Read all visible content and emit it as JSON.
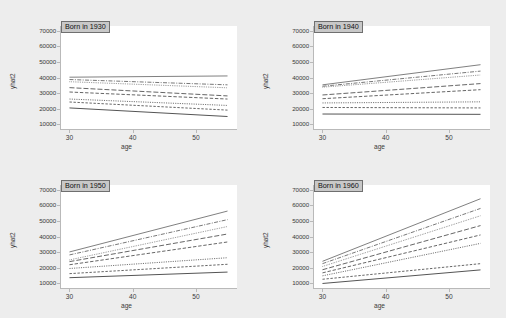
{
  "figure": {
    "panel_count": 4,
    "background_color": "#ededed",
    "plot_background_color": "#ffffff",
    "axis_color": "#b9b9b9",
    "line_color": "#555555",
    "title_box_fill": "#c8c8c8",
    "title_box_border": "#6f6f6f"
  },
  "chart_data": {
    "type": "line",
    "title": "",
    "xlabel": "age",
    "ylabel": "yhat2",
    "xlim": [
      28.5,
      56.5
    ],
    "ylim": [
      7000,
      73000
    ],
    "xticks": [
      30,
      40,
      50
    ],
    "xtick_labels": [
      "30",
      "40",
      "50"
    ],
    "yticks": [
      10000,
      20000,
      30000,
      40000,
      50000,
      60000,
      70000
    ],
    "ytick_labels": [
      "10000",
      "20000",
      "30000",
      "40000",
      "50000",
      "60000",
      "70000"
    ],
    "grid": false,
    "legend": "none",
    "x_start": 30,
    "x_end": 55,
    "line_styles": [
      "solid",
      "dash-dot",
      "dotted-fine",
      "long-dash",
      "dash",
      "dotted",
      "dash-short",
      "solid-thick"
    ],
    "panels": [
      {
        "title": "Born in 1930",
        "series": [
          {
            "name": "group-1",
            "style": "solid",
            "y_start": 40200,
            "y_end": 41000
          },
          {
            "name": "group-2",
            "style": "dash-dot",
            "y_start": 38700,
            "y_end": 35300
          },
          {
            "name": "group-3",
            "style": "dotted-fine",
            "y_start": 37300,
            "y_end": 33400
          },
          {
            "name": "group-4",
            "style": "long-dash",
            "y_start": 33500,
            "y_end": 28200
          },
          {
            "name": "group-5",
            "style": "dash",
            "y_start": 30700,
            "y_end": 26200
          },
          {
            "name": "group-6",
            "style": "dotted",
            "y_start": 26200,
            "y_end": 22100
          },
          {
            "name": "group-7",
            "style": "dash-short",
            "y_start": 24300,
            "y_end": 19100
          },
          {
            "name": "group-8",
            "style": "solid-thick",
            "y_start": 20500,
            "y_end": 15000
          }
        ]
      },
      {
        "title": "Born in 1940",
        "series": [
          {
            "name": "group-1",
            "style": "solid",
            "y_start": 35300,
            "y_end": 48200
          },
          {
            "name": "group-2",
            "style": "dash-dot",
            "y_start": 34400,
            "y_end": 44100
          },
          {
            "name": "group-3",
            "style": "dotted-fine",
            "y_start": 33800,
            "y_end": 41600
          },
          {
            "name": "group-4",
            "style": "long-dash",
            "y_start": 28800,
            "y_end": 36100
          },
          {
            "name": "group-5",
            "style": "dash",
            "y_start": 26400,
            "y_end": 32200
          },
          {
            "name": "group-6",
            "style": "dotted",
            "y_start": 23700,
            "y_end": 24400
          },
          {
            "name": "group-7",
            "style": "dash-short",
            "y_start": 20800,
            "y_end": 20500
          },
          {
            "name": "group-8",
            "style": "solid-thick",
            "y_start": 16600,
            "y_end": 16400
          }
        ]
      },
      {
        "title": "Born in 1950",
        "series": [
          {
            "name": "group-1",
            "style": "solid",
            "y_start": 30100,
            "y_end": 56300
          },
          {
            "name": "group-2",
            "style": "dash-dot",
            "y_start": 28200,
            "y_end": 50800
          },
          {
            "name": "group-3",
            "style": "dotted-fine",
            "y_start": 25000,
            "y_end": 46400
          },
          {
            "name": "group-4",
            "style": "long-dash",
            "y_start": 23900,
            "y_end": 41600
          },
          {
            "name": "group-5",
            "style": "dash",
            "y_start": 21900,
            "y_end": 36500
          },
          {
            "name": "group-6",
            "style": "dotted",
            "y_start": 19500,
            "y_end": 26400
          },
          {
            "name": "group-7",
            "style": "dash-short",
            "y_start": 16200,
            "y_end": 22200
          },
          {
            "name": "group-8",
            "style": "solid-thick",
            "y_start": 13600,
            "y_end": 17200
          }
        ]
      },
      {
        "title": "Born in 1960",
        "series": [
          {
            "name": "group-1",
            "style": "solid",
            "y_start": 24100,
            "y_end": 64200
          },
          {
            "name": "group-2",
            "style": "dash-dot",
            "y_start": 22600,
            "y_end": 58000
          },
          {
            "name": "group-3",
            "style": "dotted-fine",
            "y_start": 20800,
            "y_end": 53300
          },
          {
            "name": "group-4",
            "style": "long-dash",
            "y_start": 18700,
            "y_end": 47000
          },
          {
            "name": "group-5",
            "style": "dash",
            "y_start": 16700,
            "y_end": 41000
          },
          {
            "name": "group-6",
            "style": "dotted",
            "y_start": 14800,
            "y_end": 35600
          },
          {
            "name": "group-7",
            "style": "dash-short",
            "y_start": 12600,
            "y_end": 22600
          },
          {
            "name": "group-8",
            "style": "solid-thick",
            "y_start": 9900,
            "y_end": 18600
          }
        ]
      }
    ]
  }
}
